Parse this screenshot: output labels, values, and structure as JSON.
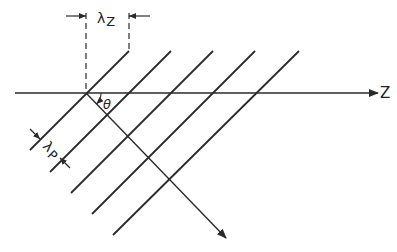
{
  "diagram": {
    "labels": {
      "lambda_z": "λ",
      "lambda_z_sub": "Z",
      "lambda_p": "λ",
      "lambda_p_sub": "P",
      "theta": "θ",
      "axis": "Z"
    },
    "colors": {
      "line": "#2a2a2a",
      "background": "#ffffff"
    },
    "wavefronts": [
      {
        "x1": 129,
        "y1": 51,
        "x2": 30,
        "y2": 150
      },
      {
        "x1": 171,
        "y1": 51,
        "x2": 50,
        "y2": 172
      },
      {
        "x1": 213,
        "y1": 51,
        "x2": 71,
        "y2": 193
      },
      {
        "x1": 255,
        "y1": 51,
        "x2": 92,
        "y2": 214
      },
      {
        "x1": 299,
        "y1": 51,
        "x2": 113,
        "y2": 235
      }
    ]
  }
}
